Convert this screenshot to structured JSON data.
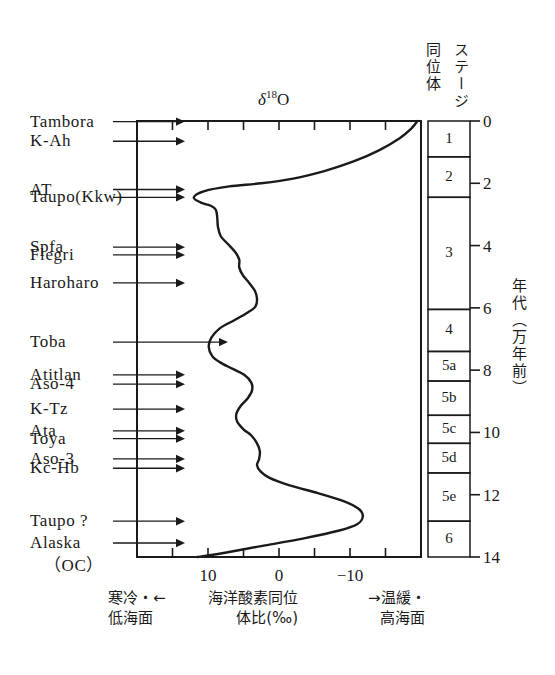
{
  "figure": {
    "title_delta": "δ",
    "title_sup": "18",
    "title_o": "O",
    "axis_label_vertical": "年代（万年前）",
    "stage_header_isotope": "同位体",
    "stage_header_stage": "ステージ"
  },
  "caption": {
    "left_line1": "寒冷・←",
    "left_line2": "低海面",
    "center_line1": "海洋酸素同位",
    "center_line2": "体比(‰)",
    "right_line1": "→温緩・",
    "right_line2": "高海面"
  },
  "tephra_labels": [
    {
      "name": "Tambora",
      "age": 0.02,
      "arrow_end": 185,
      "sub": false
    },
    {
      "name": "K-Ah",
      "age": 0.65,
      "arrow_end": 185,
      "sub": false
    },
    {
      "name": "AT",
      "age": 2.2,
      "arrow_end": 185,
      "sub": false
    },
    {
      "name": "Taupo(Kkw)",
      "age": 2.45,
      "arrow_end": 185,
      "sub": false
    },
    {
      "name": "Spfa",
      "age": 4.05,
      "arrow_end": 185,
      "sub": false
    },
    {
      "name": "Flegri",
      "age": 4.3,
      "arrow_end": 185,
      "sub": false
    },
    {
      "name": "Haroharo",
      "age": 5.2,
      "arrow_end": 185,
      "sub": false
    },
    {
      "name": "Toba",
      "age": 7.1,
      "arrow_end": 228,
      "sub": false
    },
    {
      "name": "Atitlan",
      "age": 8.15,
      "arrow_end": 185,
      "sub": false
    },
    {
      "name": "Aso-4",
      "age": 8.45,
      "arrow_end": 185,
      "sub": false
    },
    {
      "name": "K-Tz",
      "age": 9.25,
      "arrow_end": 185,
      "sub": false
    },
    {
      "name": "Ata",
      "age": 9.95,
      "arrow_end": 185,
      "sub": false
    },
    {
      "name": "Toya",
      "age": 10.2,
      "arrow_end": 185,
      "sub": false
    },
    {
      "name": "Aso-3",
      "age": 10.85,
      "arrow_end": 185,
      "sub": false
    },
    {
      "name": "Kc-Hb",
      "age": 11.15,
      "arrow_end": 185,
      "sub": false
    },
    {
      "name": "Taupo ?",
      "age": 12.85,
      "arrow_end": 185,
      "sub": false
    },
    {
      "name": "Alaska",
      "age": 13.55,
      "arrow_end": 185,
      "sub": false
    },
    {
      "name": "（OC）",
      "age": 14.3,
      "arrow_end": 0,
      "sub": true
    }
  ],
  "isotope_stages": [
    {
      "label": "1",
      "from": 0.0,
      "to": 1.15
    },
    {
      "label": "2",
      "from": 1.15,
      "to": 2.45
    },
    {
      "label": "3",
      "from": 2.45,
      "to": 6.05
    },
    {
      "label": "4",
      "from": 6.05,
      "to": 7.4
    },
    {
      "label": "5a",
      "from": 7.4,
      "to": 8.35
    },
    {
      "label": "5b",
      "from": 8.35,
      "to": 9.45
    },
    {
      "label": "5c",
      "from": 9.45,
      "to": 10.35
    },
    {
      "label": "5d",
      "from": 10.35,
      "to": 11.3
    },
    {
      "label": "5e",
      "from": 11.3,
      "to": 12.85
    },
    {
      "label": "6",
      "from": 12.85,
      "to": 14.0
    }
  ],
  "chart_data": {
    "type": "line",
    "title": "δ18O",
    "xlabel": "海洋酸素同位体比(‰)",
    "ylabel": "年代（万年前）",
    "xlim": [
      20,
      -20
    ],
    "ylim": [
      0,
      14
    ],
    "x_ticks": [
      20,
      15,
      10,
      5,
      0,
      -5,
      -10,
      -15,
      -20
    ],
    "x_tick_labels": [
      "",
      "",
      "10",
      "",
      "0",
      "",
      "-10",
      "",
      ""
    ],
    "y_ticks": [
      0,
      2,
      4,
      6,
      8,
      10,
      12,
      14
    ],
    "y_tick_labels": [
      "0",
      "2",
      "4",
      "6",
      "8",
      "10",
      "12",
      "14"
    ],
    "grid": false,
    "legend": null,
    "series": [
      {
        "name": "delta18O",
        "comment": "x = per-mil value (axis reversed, positive left), y = age in 10k years BP",
        "points": [
          [
            -19.5,
            0.0
          ],
          [
            -18.6,
            0.25
          ],
          [
            -17.0,
            0.55
          ],
          [
            -14.0,
            0.95
          ],
          [
            -10.5,
            1.3
          ],
          [
            -6.5,
            1.6
          ],
          [
            -2.0,
            1.85
          ],
          [
            2.5,
            2.0
          ],
          [
            7.0,
            2.1
          ],
          [
            10.5,
            2.25
          ],
          [
            12.0,
            2.45
          ],
          [
            11.0,
            2.62
          ],
          [
            9.6,
            2.72
          ],
          [
            8.9,
            2.85
          ],
          [
            8.7,
            3.1
          ],
          [
            8.6,
            3.4
          ],
          [
            8.2,
            3.7
          ],
          [
            7.2,
            3.95
          ],
          [
            6.2,
            4.2
          ],
          [
            5.6,
            4.45
          ],
          [
            5.6,
            4.7
          ],
          [
            5.1,
            4.95
          ],
          [
            4.2,
            5.2
          ],
          [
            3.4,
            5.45
          ],
          [
            3.1,
            5.7
          ],
          [
            3.3,
            5.95
          ],
          [
            4.4,
            6.15
          ],
          [
            6.3,
            6.4
          ],
          [
            8.3,
            6.65
          ],
          [
            9.5,
            6.95
          ],
          [
            9.9,
            7.25
          ],
          [
            9.4,
            7.55
          ],
          [
            8.3,
            7.75
          ],
          [
            6.6,
            7.95
          ],
          [
            4.9,
            8.15
          ],
          [
            3.9,
            8.4
          ],
          [
            3.8,
            8.65
          ],
          [
            4.4,
            8.9
          ],
          [
            5.4,
            9.15
          ],
          [
            6.0,
            9.4
          ],
          [
            5.9,
            9.65
          ],
          [
            5.0,
            9.9
          ],
          [
            3.9,
            10.1
          ],
          [
            3.1,
            10.35
          ],
          [
            2.7,
            10.6
          ],
          [
            2.8,
            10.85
          ],
          [
            3.1,
            11.05
          ],
          [
            2.6,
            11.25
          ],
          [
            1.4,
            11.45
          ],
          [
            -1.5,
            11.7
          ],
          [
            -5.5,
            11.95
          ],
          [
            -9.0,
            12.2
          ],
          [
            -11.2,
            12.45
          ],
          [
            -11.8,
            12.7
          ],
          [
            -11.0,
            12.95
          ],
          [
            -8.5,
            13.15
          ],
          [
            -3.5,
            13.4
          ],
          [
            2.5,
            13.65
          ],
          [
            8.0,
            13.88
          ],
          [
            11.5,
            14.0
          ]
        ]
      }
    ]
  }
}
